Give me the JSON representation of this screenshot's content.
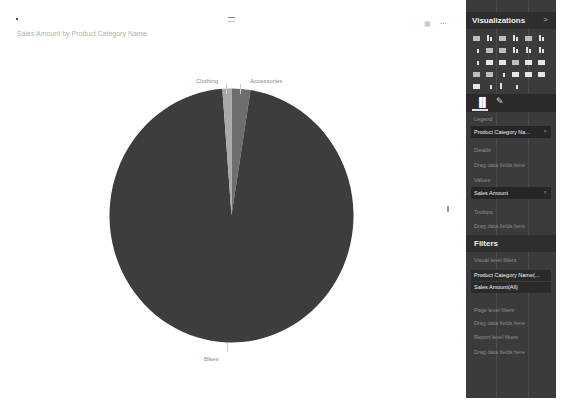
{
  "canvas": {
    "chart_title": "Sales Amount by Product Category Name",
    "icons": [
      "drag-handle-icon",
      "focus-mode-icon",
      "more-options-icon"
    ],
    "more_label": "..."
  },
  "chart_data": {
    "type": "pie",
    "title": "Sales Amount by Product Category Name",
    "categories": [
      "Accessories",
      "Bikes",
      "Clothing"
    ],
    "values": [
      2.5,
      96.3,
      1.2
    ],
    "value_units": "approx. % of Sales Amount (estimated from slice angles)",
    "colors": [
      "#6e6e6e",
      "#3d3d3d",
      "#a9a9a9"
    ],
    "labels": [
      "Accessories",
      "Bikes",
      "Clothing"
    ],
    "legend": "none (data labels shown outside slices)",
    "start_angle": "12 o'clock, clockwise"
  },
  "visualizations_pane": {
    "title": "Visualizations",
    "collapse_icon": ">",
    "tabs": [
      {
        "name": "fields",
        "icon": "fields-icon",
        "glyph": "▐▌",
        "active": true
      },
      {
        "name": "format",
        "icon": "paint-roller-icon",
        "glyph": "✎",
        "active": false
      }
    ],
    "sections": {
      "legend": {
        "label": "Legend",
        "field": "Product Category Na...",
        "remove": "×"
      },
      "details": {
        "label": "Details",
        "placeholder": "Drag data fields here"
      },
      "values": {
        "label": "Values",
        "field": "Sales Amount",
        "remove": "×"
      },
      "tooltips": {
        "label": "Tooltips",
        "placeholder": "Drag data fields here"
      }
    }
  },
  "filters_pane": {
    "title": "Filters",
    "visual_level_label": "Visual level filters",
    "visual_filters": [
      "Product Category Name(...",
      "Sales Amount(All)"
    ],
    "page_level_label": "Page level filters",
    "page_placeholder": "Drag data fields here",
    "report_level_label": "Report level filters",
    "report_placeholder": "Drag data fields here"
  }
}
